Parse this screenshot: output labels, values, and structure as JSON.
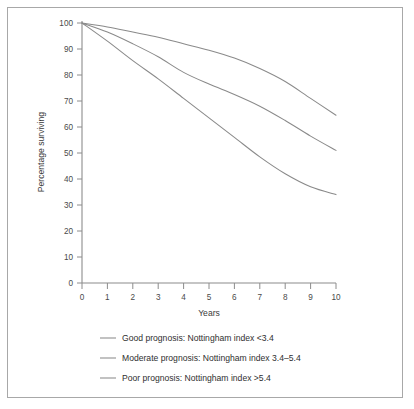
{
  "figure": {
    "kind": "survival-curve-figure",
    "frame_color": "#a8a8a8",
    "background": "#ffffff",
    "line_color": "#8a8a8a"
  },
  "chart_data": {
    "type": "line",
    "title": "",
    "xlabel": "Years",
    "ylabel": "Percentage surviving",
    "xlim": [
      0,
      10
    ],
    "ylim": [
      0,
      100
    ],
    "grid": false,
    "legend_position": "below",
    "x_ticks": [
      "0",
      "1",
      "2",
      "3",
      "4",
      "5",
      "6",
      "7",
      "8",
      "9",
      "10"
    ],
    "y_ticks": [
      "0",
      "10",
      "20",
      "30",
      "40",
      "50",
      "60",
      "70",
      "80",
      "90",
      "100"
    ],
    "x": [
      0,
      1,
      2,
      3,
      4,
      5,
      6,
      7,
      8,
      9,
      10
    ],
    "series": [
      {
        "name": "Good prognosis: Nottingham index <3.4",
        "values": [
          100,
          98.5,
          96.5,
          94.5,
          92,
          89.5,
          86.5,
          82.5,
          77.5,
          71,
          64.5
        ]
      },
      {
        "name": "Moderate prognosis: Nottingham index 3.4–5.4",
        "values": [
          100,
          96.5,
          92,
          87,
          81,
          76.5,
          72.5,
          68,
          62.5,
          56.5,
          51
        ]
      },
      {
        "name": "Poor prognosis: Nottingham index >5.4",
        "values": [
          100,
          93,
          85.5,
          78.5,
          71,
          63.5,
          56,
          48.5,
          42,
          37,
          34
        ]
      }
    ]
  },
  "legend": {
    "entries": [
      {
        "label": "Good prognosis: Nottingham index <3.4"
      },
      {
        "label": "Moderate prognosis: Nottingham index 3.4–5.4"
      },
      {
        "label": "Poor prognosis: Nottingham index >5.4"
      }
    ]
  }
}
